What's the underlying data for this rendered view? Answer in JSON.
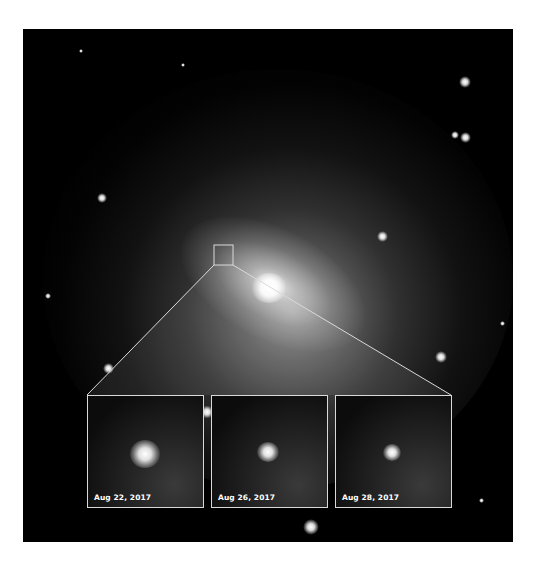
{
  "figure": {
    "selection_box": {
      "x": 214,
      "y": 245,
      "w": 19,
      "h": 20
    },
    "line_color": "#d9d9d9",
    "panels": [
      {
        "label": "Aug 22, 2017",
        "x": 87,
        "y": 395,
        "spot_size": 28
      },
      {
        "label": "Aug 26, 2017",
        "x": 211,
        "y": 395,
        "spot_size": 22
      },
      {
        "label": "Aug 28, 2017",
        "x": 335,
        "y": 395,
        "spot_size": 18
      }
    ]
  }
}
